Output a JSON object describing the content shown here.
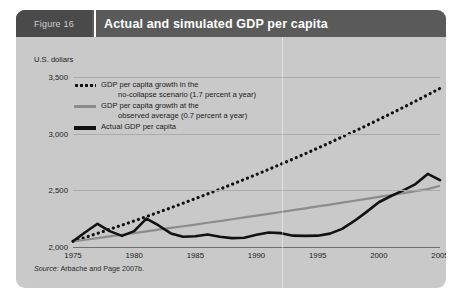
{
  "figure": {
    "number_label": "Figure 16",
    "title": "Actual and simulated GDP per capita",
    "source_prefix": "Source:",
    "source_text": " Arbache and Page 2007b."
  },
  "legend": [
    {
      "key": "no-collapse",
      "style": "dotted",
      "line1": "GDP per capita growth in the",
      "line2": "no-collapse scenario (1.7 percent a year)"
    },
    {
      "key": "observed-average",
      "style": "solid-gray",
      "line1": "GDP per capita growth at the",
      "line2": "observed average (0.7 percent a year)"
    },
    {
      "key": "actual",
      "style": "solid-black",
      "line1": "Actual GDP per capita",
      "line2": ""
    }
  ],
  "colors": {
    "panel_background": "#c9c9c9",
    "header_bar": "#5a5a5a",
    "figure_number_box": "#4a4a4a",
    "title_text": "#ffffff",
    "gridline": "#ababab",
    "actual_line": "#111111",
    "observed_average_line": "#8c8c8c",
    "no_collapse_line": "#111111"
  },
  "chart_data": {
    "type": "line",
    "title": "Actual and simulated GDP per capita",
    "xlabel": "",
    "ylabel": "U.S. dollars",
    "ylim": [
      2000,
      3500
    ],
    "xlim": [
      1975,
      2005
    ],
    "grid": true,
    "legend_position": "top-left-inside",
    "yticks": [
      "2,000",
      "2,500",
      "3,000",
      "3,500"
    ],
    "ytick_values": [
      2000,
      2500,
      3000,
      3500
    ],
    "xticks": [
      "1975",
      "1980",
      "1985",
      "1990",
      "1995",
      "2000",
      "2005"
    ],
    "xtick_values": [
      1975,
      1980,
      1985,
      1990,
      1995,
      2000,
      2005
    ],
    "x": [
      1975,
      1976,
      1977,
      1978,
      1979,
      1980,
      1981,
      1982,
      1983,
      1984,
      1985,
      1986,
      1987,
      1988,
      1989,
      1990,
      1991,
      1992,
      1993,
      1994,
      1995,
      1996,
      1997,
      1998,
      1999,
      2000,
      2001,
      2002,
      2003,
      2004,
      2005
    ],
    "series": [
      {
        "name": "GDP per capita growth in the no-collapse scenario (1.7 percent a year)",
        "style": "dotted",
        "color": "#111111",
        "growth_rate_percent": 1.7,
        "values": [
          2050,
          2085,
          2120,
          2156,
          2193,
          2230,
          2268,
          2307,
          2346,
          2386,
          2427,
          2468,
          2510,
          2553,
          2596,
          2640,
          2685,
          2731,
          2777,
          2824,
          2872,
          2921,
          2971,
          3021,
          3072,
          3125,
          3178,
          3232,
          3287,
          3343,
          3400
        ]
      },
      {
        "name": "GDP per capita growth at the observed average (0.7 percent a year)",
        "style": "solid",
        "color": "#8c8c8c",
        "growth_rate_percent": 0.7,
        "values": [
          2050,
          2064,
          2079,
          2093,
          2108,
          2123,
          2138,
          2153,
          2168,
          2183,
          2198,
          2214,
          2229,
          2245,
          2261,
          2277,
          2293,
          2309,
          2325,
          2341,
          2358,
          2374,
          2391,
          2408,
          2425,
          2442,
          2459,
          2476,
          2493,
          2511,
          2540
        ]
      },
      {
        "name": "Actual GDP per capita",
        "style": "solid-bold",
        "color": "#111111",
        "values": [
          2050,
          2130,
          2205,
          2140,
          2098,
          2140,
          2250,
          2190,
          2120,
          2090,
          2095,
          2110,
          2090,
          2078,
          2082,
          2108,
          2128,
          2122,
          2100,
          2098,
          2100,
          2118,
          2160,
          2230,
          2310,
          2395,
          2450,
          2500,
          2555,
          2645,
          2590
        ]
      }
    ]
  }
}
